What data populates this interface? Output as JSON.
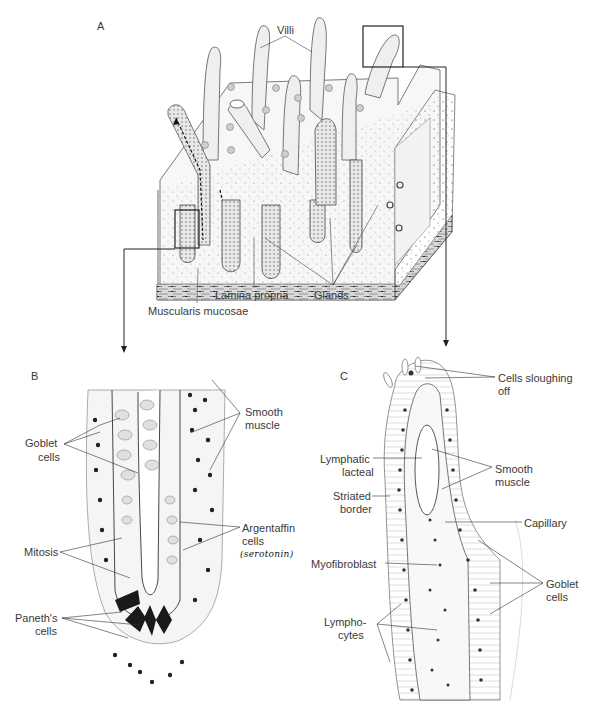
{
  "figure": {
    "panels": {
      "A": {
        "letter": "A",
        "title": "Block of small intestinal mucosa",
        "labels": {
          "villi": "Villi",
          "lamina_propria": "Lamina propria",
          "glands": "Glands",
          "muscularis_mucosae": "Muscularis mucosae"
        }
      },
      "B": {
        "letter": "B",
        "title": "Intestinal gland (crypt)",
        "labels": {
          "goblet_cells_1": "Goblet",
          "goblet_cells_2": "cells",
          "smooth_muscle_1": "Smooth",
          "smooth_muscle_2": "muscle",
          "mitosis": "Mitosis",
          "argentaffin_1": "Argentaffin",
          "argentaffin_2": "cells",
          "handwritten_note": "(serotonin)",
          "paneth_1": "Paneth's",
          "paneth_2": "cells"
        }
      },
      "C": {
        "letter": "C",
        "title": "Villus",
        "labels": {
          "sloughing_1": "Cells sloughing",
          "sloughing_2": "off",
          "lymphatic_1": "Lymphatic",
          "lymphatic_2": "lacteal",
          "smooth_muscle_1": "Smooth",
          "smooth_muscle_2": "muscle",
          "striated_1": "Striated",
          "striated_2": "border",
          "capillary": "Capillary",
          "myofibroblast": "Myofibroblast",
          "goblet_1": "Goblet",
          "goblet_2": "cells",
          "lympho_1": "Lympho-",
          "lympho_2": "cytes"
        }
      }
    },
    "colors": {
      "ink": "#2a2a2a",
      "label": "#3a3a3a",
      "stipple": "#8a8a8a",
      "muscle_band": "#6e6e6e",
      "background": "#ffffff"
    }
  }
}
